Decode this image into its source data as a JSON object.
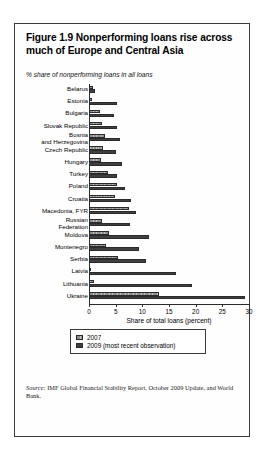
{
  "figure": {
    "title": "Figure 1.9  Nonperforming loans rise across much of Europe and Central Asia",
    "subtitle": "% share of nonperforming loans in all loans",
    "source_word": "Source:",
    "source_text": " IMF Global Financial Stability Report, October 2009 Update, and World Bank."
  },
  "legend": {
    "items": [
      {
        "label": "2007",
        "color": "#8f8f8f"
      },
      {
        "label": "2009 (most recent observation)",
        "color": "#3f3f3f"
      }
    ]
  },
  "chart_data": {
    "type": "bar",
    "orientation": "horizontal",
    "title": "Figure 1.9  Nonperforming loans rise across much of Europe and Central Asia",
    "subtitle": "% share of nonperforming loans in all loans",
    "xlabel": "Share of total loans (percent)",
    "ylabel": "",
    "xlim": [
      0,
      30
    ],
    "xticks": [
      0,
      5,
      10,
      15,
      20,
      25,
      30
    ],
    "xtick_labels": [
      "0",
      "5",
      "10",
      "15",
      "20",
      "25",
      "30"
    ],
    "grid": false,
    "legend_position": "bottom",
    "categories": [
      "Belarus",
      "Estonia",
      "Bulgaria",
      "Slovak Republic",
      "Bosnia\nand Herzegovina",
      "Czech Republic",
      "Hungary",
      "Turkey",
      "Poland",
      "Croatia",
      "Macedonia, FYR",
      "Russian\nFederation",
      "Moldova",
      "Montenegro",
      "Serbia",
      "Latvia",
      "Lithuania",
      "Ukraine"
    ],
    "series": [
      {
        "name": "2007",
        "color": "#8f8f8f",
        "values": [
          0.7,
          0.5,
          2.1,
          2.5,
          3.0,
          2.7,
          2.3,
          3.5,
          5.2,
          4.9,
          7.5,
          2.5,
          3.7,
          3.2,
          5.4,
          0.4,
          1.0,
          13.2
        ]
      },
      {
        "name": "2009 (most recent observation)",
        "color": "#3f3f3f",
        "values": [
          1.2,
          5.2,
          4.7,
          5.3,
          5.8,
          5.1,
          6.1,
          5.3,
          6.7,
          7.9,
          8.9,
          7.6,
          11.3,
          9.3,
          10.6,
          16.4,
          19.4,
          29.3
        ]
      }
    ]
  }
}
